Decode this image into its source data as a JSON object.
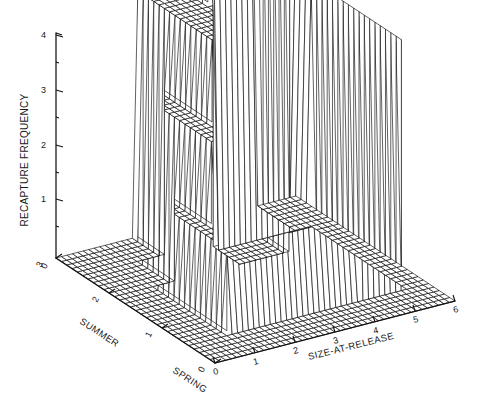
{
  "figure": {
    "title": "",
    "background_color": "#ffffff",
    "line_color": "#000000",
    "text_color": "#1a1a1a"
  },
  "axes": {
    "vertical": {
      "name": "RECAPTURE FREQUENCY",
      "label": "RECAPTURE FREQUENCY",
      "ticks": [
        "0",
        "1",
        "2",
        "3",
        "4"
      ],
      "min": 0,
      "max": 4
    },
    "left_depth": {
      "name": "SEASON",
      "label_near": "SUMMER",
      "label_far": "SPRING",
      "ticks": [
        "0",
        "1",
        "2",
        "3"
      ],
      "min": 0,
      "max": 3
    },
    "right_horizontal": {
      "name": "SIZE-AT-RELEASE",
      "label": "SIZE-AT-RELEASE",
      "ticks": [
        "0",
        "1",
        "2",
        "3",
        "4",
        "5",
        "6"
      ],
      "min": 0,
      "max": 6
    }
  },
  "chart_data": {
    "type": "surface",
    "title": "",
    "xlabel": "SIZE-AT-RELEASE",
    "ylabel": "SEASON",
    "zlabel": "RECAPTURE FREQUENCY",
    "xlim": [
      0,
      6
    ],
    "ylim": [
      0,
      3
    ],
    "zlim": [
      0,
      4
    ],
    "grid": false,
    "legend": "none",
    "style": "wireframe-mesh surface with white faces and black grid lines",
    "x": [
      0,
      1,
      2,
      3,
      4,
      5,
      6
    ],
    "y": [
      0,
      1,
      2,
      3
    ],
    "y_labels": [
      "",
      "SPRING",
      "",
      "SUMMER"
    ],
    "z_matrix_note": "z[y_index][x_index] = recapture frequency, stepped plateaus",
    "z": [
      [
        0,
        0,
        0,
        0,
        0,
        0,
        0
      ],
      [
        0,
        0,
        1,
        1,
        0,
        2,
        0
      ],
      [
        0,
        1,
        2,
        3,
        1,
        3,
        0
      ],
      [
        0,
        1,
        2,
        4,
        4,
        3,
        0
      ]
    ],
    "plateaus": [
      {
        "height": 4,
        "x_range": [
          3,
          5
        ],
        "y_range": [
          2.4,
          3
        ],
        "note": "tallest rear plateau"
      },
      {
        "height": 3,
        "x_range": [
          2,
          3
        ],
        "y_range": [
          1.6,
          3
        ],
        "note": "mid-rear terrace"
      },
      {
        "height": 3,
        "x_range": [
          4.3,
          5.4
        ],
        "y_range": [
          0.6,
          2.2
        ],
        "note": "right tall block"
      },
      {
        "height": 2,
        "x_range": [
          1.5,
          3
        ],
        "y_range": [
          1.2,
          2.4
        ],
        "note": "second terrace"
      },
      {
        "height": 1,
        "x_range": [
          1,
          4.4
        ],
        "y_range": [
          0.6,
          1.8
        ],
        "note": "low front terrace"
      },
      {
        "height": 0,
        "x_range": [
          0,
          6
        ],
        "y_range": [
          0,
          3
        ],
        "note": "base plane"
      }
    ]
  }
}
